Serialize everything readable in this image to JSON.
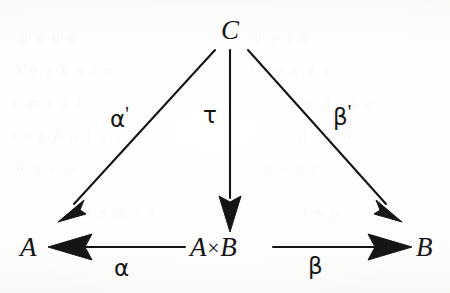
{
  "figure": {
    "kind": "commutative-diagram",
    "width": 450,
    "height": 293,
    "background_color": "#fdfdfc",
    "ink_color": "#151515"
  },
  "nodes": [
    {
      "id": "C",
      "label": "C",
      "x": 232,
      "y": 30,
      "role": "apex-object"
    },
    {
      "id": "A",
      "label": "A",
      "x": 30,
      "y": 248,
      "role": "left-object"
    },
    {
      "id": "AxB",
      "label": "A",
      "label_right": "B",
      "symbol": "×",
      "x": 228,
      "y": 248,
      "role": "product-object"
    },
    {
      "id": "B",
      "label": "B",
      "x": 425,
      "y": 248,
      "role": "right-object"
    }
  ],
  "edges": [
    {
      "id": "alpha-prime",
      "label": "α",
      "prime": "'",
      "from": "C",
      "to": "A",
      "label_x": 118,
      "label_y": 115,
      "direction": "down-left"
    },
    {
      "id": "tau",
      "label": "τ",
      "prime": "",
      "from": "C",
      "to": "AxB",
      "label_x": 208,
      "label_y": 115,
      "direction": "down"
    },
    {
      "id": "beta-prime",
      "label": "β",
      "prime": "'",
      "from": "C",
      "to": "B",
      "label_x": 340,
      "label_y": 115,
      "direction": "down-right"
    },
    {
      "id": "alpha",
      "label": "α",
      "prime": "",
      "from": "AxB",
      "to": "A",
      "label_x": 122,
      "label_y": 262,
      "direction": "left"
    },
    {
      "id": "beta",
      "label": "β",
      "prime": "",
      "from": "AxB",
      "to": "B",
      "label_x": 315,
      "label_y": 262,
      "direction": "right"
    }
  ],
  "ghost_text": [
    {
      "text": "a  b  a  h",
      "x": 18,
      "y": 30
    },
    {
      "text": "n  t  e  a  s  o  f",
      "x": 14,
      "y": 62
    },
    {
      "text": "f  o  r  m  e",
      "x": 8,
      "y": 95
    },
    {
      "text": "s e   i  n    h  a t  i",
      "x": 10,
      "y": 128
    },
    {
      "text": "m e   c  h",
      "x": 14,
      "y": 160
    },
    {
      "text": "n  t   o  b",
      "x": 252,
      "y": 30
    },
    {
      "text": "r  y   a   o   f  t",
      "x": 246,
      "y": 62
    },
    {
      "text": "o f   t h e   p r o",
      "x": 258,
      "y": 95
    },
    {
      "text": "b  e   t   h  a  t",
      "x": 268,
      "y": 128
    },
    {
      "text": "t   h   e   n",
      "x": 262,
      "y": 160
    },
    {
      "text": "a  r   m   e   n",
      "x": 80,
      "y": 204
    },
    {
      "text": "d  e  f",
      "x": 300,
      "y": 204
    }
  ]
}
